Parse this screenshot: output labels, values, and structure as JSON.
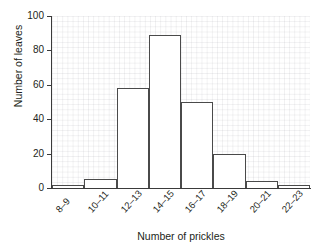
{
  "chart_data": {
    "type": "bar",
    "title": "",
    "subtitle": "",
    "xlabel": "Number of prickles",
    "ylabel": "Number of leaves",
    "categories": [
      "8–9",
      "10–11",
      "12–13",
      "14–15",
      "16–17",
      "18–19",
      "20–21",
      "22–23"
    ],
    "values": [
      2,
      5,
      58,
      89,
      50,
      20,
      4,
      2
    ],
    "ylim": [
      0,
      100
    ],
    "ytick_labels": [
      "0",
      "20",
      "40",
      "60",
      "80",
      "100"
    ],
    "ytick_values": [
      0,
      20,
      40,
      60,
      80,
      100
    ],
    "grid": true,
    "legend": "none",
    "annotations": [],
    "colors": {
      "bar_fill": "#ffffff",
      "bar_edge": "#4a4a4a",
      "axis": "#3a3a3a",
      "grid": "#d8d8dd",
      "text": "#231f20",
      "background": "#ffffff"
    }
  }
}
